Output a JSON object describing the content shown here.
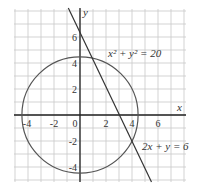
{
  "diagram": {
    "grid": {
      "xmin": -5,
      "xmax": 8,
      "ymin": -5,
      "ymax": 8,
      "step": 1,
      "color": "#c8c8c8"
    },
    "axes": {
      "x_label": "x",
      "y_label": "y",
      "color": "#222222"
    },
    "x_ticks": [
      "-4",
      "-2",
      "0",
      "2",
      "4",
      "6"
    ],
    "y_ticks": [
      "6",
      "4",
      "2",
      "-2",
      "-4"
    ],
    "curves": [
      {
        "type": "circle",
        "equation": "x² + y² = 20",
        "radius_squared": 20,
        "color": "#555555"
      },
      {
        "type": "line",
        "equation": "2x + y = 6",
        "color": "#333333"
      }
    ],
    "labels": {
      "circle_label": "x² + y² = 20",
      "line_label": "2x + y = 6"
    }
  }
}
